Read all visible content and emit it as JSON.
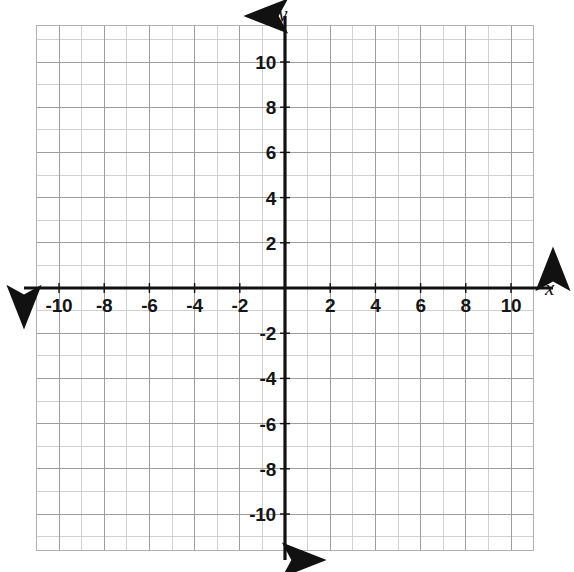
{
  "figure": {
    "title": "",
    "background_color": "#ffffff",
    "type": "coordinate-plane"
  },
  "axes": {
    "x_axis_label": "x",
    "y_axis_label": "y",
    "axis_color": "#111111",
    "grid_color": "#9a9a9a",
    "minor_grid_color": "#c9c9c9"
  },
  "chart_data": {
    "type": "scatter",
    "title": "",
    "xlabel": "x",
    "ylabel": "y",
    "xlim": [
      -11,
      11
    ],
    "ylim": [
      -11.6,
      11.6
    ],
    "grid": true,
    "legend": null,
    "series": [],
    "x_tick_labels": [
      "-10",
      "-8",
      "-6",
      "-4",
      "-2",
      "2",
      "4",
      "6",
      "8",
      "10"
    ],
    "x_tick_values": [
      -10,
      -8,
      -6,
      -4,
      -2,
      2,
      4,
      6,
      8,
      10
    ],
    "y_tick_labels": [
      "10",
      "8",
      "6",
      "4",
      "2",
      "-2",
      "-4",
      "-6",
      "-8",
      "-10"
    ],
    "y_tick_values": [
      10,
      8,
      6,
      4,
      2,
      -2,
      -4,
      -6,
      -8,
      -10
    ],
    "tick_step": 2,
    "minor_step": 1,
    "annotations": []
  },
  "ticks": {
    "x": [
      {
        "label": "-10",
        "value": -10
      },
      {
        "label": "-8",
        "value": -8
      },
      {
        "label": "-6",
        "value": -6
      },
      {
        "label": "-4",
        "value": -4
      },
      {
        "label": "-2",
        "value": -2
      },
      {
        "label": "2",
        "value": 2
      },
      {
        "label": "4",
        "value": 4
      },
      {
        "label": "6",
        "value": 6
      },
      {
        "label": "8",
        "value": 8
      },
      {
        "label": "10",
        "value": 10
      }
    ],
    "y": [
      {
        "label": "10",
        "value": 10
      },
      {
        "label": "8",
        "value": 8
      },
      {
        "label": "6",
        "value": 6
      },
      {
        "label": "4",
        "value": 4
      },
      {
        "label": "2",
        "value": 2
      },
      {
        "label": "-2",
        "value": -2
      },
      {
        "label": "-4",
        "value": -4
      },
      {
        "label": "-6",
        "value": -6
      },
      {
        "label": "-8",
        "value": -8
      },
      {
        "label": "-10",
        "value": -10
      }
    ]
  }
}
